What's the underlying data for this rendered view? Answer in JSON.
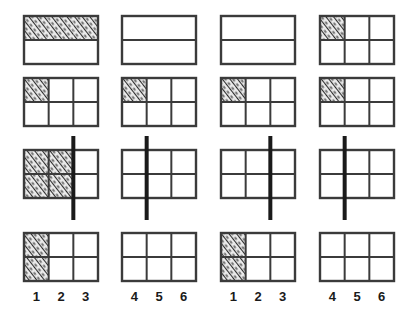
{
  "figure": {
    "title": "",
    "background_color": "#ffffff",
    "stroke_color": "#3b3b3b",
    "marker_color": "#1a1a1a",
    "hatch_color": "#2b2b2b",
    "hatch_fill": "#e8e8e8",
    "rows": 4,
    "columns": 4,
    "cell_width": 74,
    "cell_height": 48,
    "grid_cols": 3,
    "grid_rows": 2,
    "axis_labels": {
      "left_set": [
        "1",
        "2",
        "3"
      ],
      "right_set": [
        "4",
        "5",
        "6"
      ]
    },
    "panels": [
      {
        "id": "r1c1",
        "row": 1,
        "col": 1,
        "x": 24,
        "y": 16,
        "vertical_dividers": 0,
        "horizontal_dividers": 1,
        "shaded": [
          [
            0,
            0
          ],
          [
            0,
            1
          ],
          [
            0,
            2
          ]
        ],
        "shade_mode": "full-top-row",
        "marker": null,
        "labels": []
      },
      {
        "id": "r1c2",
        "row": 1,
        "col": 2,
        "x": 122,
        "y": 16,
        "vertical_dividers": 0,
        "horizontal_dividers": 1,
        "shaded": [],
        "shade_mode": "none",
        "marker": null,
        "labels": []
      },
      {
        "id": "r1c3",
        "row": 1,
        "col": 3,
        "x": 221,
        "y": 16,
        "vertical_dividers": 0,
        "horizontal_dividers": 1,
        "shaded": [],
        "shade_mode": "none",
        "marker": null,
        "labels": []
      },
      {
        "id": "r1c4",
        "row": 1,
        "col": 4,
        "x": 320,
        "y": 16,
        "vertical_dividers": 2,
        "horizontal_dividers": 1,
        "shaded": [
          [
            0,
            0
          ]
        ],
        "shade_mode": "cell",
        "marker": null,
        "labels": []
      },
      {
        "id": "r2c1",
        "row": 2,
        "col": 1,
        "x": 24,
        "y": 78,
        "vertical_dividers": 2,
        "horizontal_dividers": 1,
        "shaded": [
          [
            0,
            0
          ]
        ],
        "shade_mode": "cell",
        "marker": null,
        "labels": []
      },
      {
        "id": "r2c2",
        "row": 2,
        "col": 2,
        "x": 122,
        "y": 78,
        "vertical_dividers": 2,
        "horizontal_dividers": 1,
        "shaded": [
          [
            0,
            0
          ]
        ],
        "shade_mode": "cell",
        "marker": null,
        "labels": []
      },
      {
        "id": "r2c3",
        "row": 2,
        "col": 3,
        "x": 221,
        "y": 78,
        "vertical_dividers": 2,
        "horizontal_dividers": 1,
        "shaded": [
          [
            0,
            0
          ]
        ],
        "shade_mode": "cell",
        "marker": null,
        "labels": []
      },
      {
        "id": "r2c4",
        "row": 2,
        "col": 4,
        "x": 320,
        "y": 78,
        "vertical_dividers": 2,
        "horizontal_dividers": 1,
        "shaded": [
          [
            0,
            0
          ]
        ],
        "shade_mode": "cell",
        "marker": null,
        "labels": []
      },
      {
        "id": "r3c1",
        "row": 3,
        "col": 1,
        "x": 24,
        "y": 150,
        "vertical_dividers": 2,
        "horizontal_dividers": 1,
        "shaded": [
          [
            0,
            0
          ],
          [
            0,
            1
          ],
          [
            1,
            0
          ],
          [
            1,
            1
          ]
        ],
        "shade_mode": "cells",
        "marker": {
          "position_fraction": 0.6667,
          "overhang_top": 14,
          "overhang_bottom": 22,
          "width": 4
        },
        "labels": []
      },
      {
        "id": "r3c2",
        "row": 3,
        "col": 2,
        "x": 122,
        "y": 150,
        "vertical_dividers": 2,
        "horizontal_dividers": 1,
        "shaded": [],
        "shade_mode": "none",
        "marker": {
          "position_fraction": 0.3333,
          "overhang_top": 14,
          "overhang_bottom": 22,
          "width": 4
        },
        "labels": []
      },
      {
        "id": "r3c3",
        "row": 3,
        "col": 3,
        "x": 221,
        "y": 150,
        "vertical_dividers": 2,
        "horizontal_dividers": 1,
        "shaded": [],
        "shade_mode": "none",
        "marker": {
          "position_fraction": 0.6667,
          "overhang_top": 14,
          "overhang_bottom": 22,
          "width": 4
        },
        "labels": []
      },
      {
        "id": "r3c4",
        "row": 3,
        "col": 4,
        "x": 320,
        "y": 150,
        "vertical_dividers": 2,
        "horizontal_dividers": 1,
        "shaded": [],
        "shade_mode": "none",
        "marker": {
          "position_fraction": 0.3333,
          "overhang_top": 14,
          "overhang_bottom": 22,
          "width": 4
        },
        "labels": []
      },
      {
        "id": "r4c1",
        "row": 4,
        "col": 1,
        "x": 24,
        "y": 233,
        "vertical_dividers": 2,
        "horizontal_dividers": 1,
        "shaded": [
          [
            0,
            0
          ],
          [
            1,
            0
          ]
        ],
        "shade_mode": "cells",
        "marker": null,
        "labels": [
          "1",
          "2",
          "3"
        ]
      },
      {
        "id": "r4c2",
        "row": 4,
        "col": 2,
        "x": 122,
        "y": 233,
        "vertical_dividers": 2,
        "horizontal_dividers": 1,
        "shaded": [],
        "shade_mode": "none",
        "marker": null,
        "labels": [
          "4",
          "5",
          "6"
        ]
      },
      {
        "id": "r4c3",
        "row": 4,
        "col": 3,
        "x": 221,
        "y": 233,
        "vertical_dividers": 2,
        "horizontal_dividers": 1,
        "shaded": [
          [
            0,
            0
          ],
          [
            1,
            0
          ]
        ],
        "shade_mode": "cells",
        "marker": null,
        "labels": [
          "1",
          "2",
          "3"
        ]
      },
      {
        "id": "r4c4",
        "row": 4,
        "col": 4,
        "x": 320,
        "y": 233,
        "vertical_dividers": 2,
        "horizontal_dividers": 1,
        "shaded": [],
        "shade_mode": "none",
        "marker": null,
        "labels": [
          "4",
          "5",
          "6"
        ]
      }
    ]
  }
}
